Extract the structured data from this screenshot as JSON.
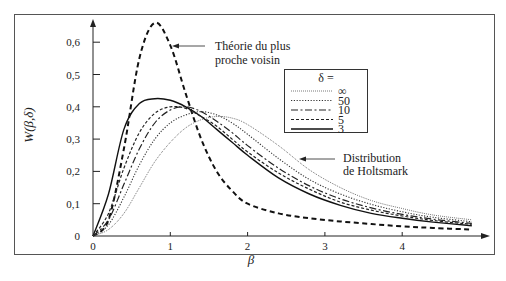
{
  "chart_data": {
    "type": "line",
    "title": "",
    "xlabel": "β",
    "ylabel": "W(β,δ)",
    "xlim": [
      0,
      5
    ],
    "ylim": [
      0,
      0.68
    ],
    "x_ticks": [
      "0",
      "1",
      "2",
      "3",
      "4"
    ],
    "y_ticks": [
      "0",
      "0,1",
      "0,2",
      "0,3",
      "0,4",
      "0,5",
      "0,6"
    ],
    "grid": false,
    "legend": {
      "title": "δ =",
      "position": "upper right (inside)",
      "entries": [
        "∞",
        "50",
        "10",
        "5",
        "3"
      ]
    },
    "annotations": [
      {
        "text_line1": "Théorie du plus",
        "text_line2": "proche voisin",
        "target": "nearest-neighbor curve peak"
      },
      {
        "text_line1": "Distribution",
        "text_line2": "de Holtsmark",
        "target": "δ = ∞ curve"
      }
    ],
    "x": [
      0,
      0.2,
      0.4,
      0.6,
      0.8,
      1.0,
      1.2,
      1.4,
      1.6,
      1.8,
      2.0,
      2.4,
      2.8,
      3.2,
      3.6,
      4.0,
      4.4,
      4.9
    ],
    "series": [
      {
        "name": "Théorie du plus proche voisin",
        "style": "thick-dashed",
        "values": [
          0,
          0.05,
          0.27,
          0.55,
          0.66,
          0.59,
          0.44,
          0.3,
          0.2,
          0.14,
          0.1,
          0.07,
          0.055,
          0.045,
          0.037,
          0.03,
          0.025,
          0.02
        ]
      },
      {
        "name": "δ = 3",
        "style": "solid",
        "values": [
          0,
          0.13,
          0.33,
          0.41,
          0.425,
          0.42,
          0.4,
          0.37,
          0.33,
          0.29,
          0.25,
          0.18,
          0.13,
          0.095,
          0.07,
          0.055,
          0.043,
          0.032
        ]
      },
      {
        "name": "δ = 5",
        "style": "short-dashed",
        "values": [
          0,
          0.07,
          0.21,
          0.32,
          0.38,
          0.4,
          0.395,
          0.37,
          0.34,
          0.3,
          0.26,
          0.195,
          0.145,
          0.105,
          0.08,
          0.062,
          0.048,
          0.036
        ]
      },
      {
        "name": "δ = 10",
        "style": "dash-dot",
        "values": [
          0,
          0.05,
          0.16,
          0.27,
          0.35,
          0.39,
          0.4,
          0.385,
          0.355,
          0.32,
          0.28,
          0.21,
          0.155,
          0.115,
          0.087,
          0.067,
          0.052,
          0.039
        ]
      },
      {
        "name": "δ = 50",
        "style": "dotted",
        "values": [
          0,
          0.035,
          0.12,
          0.22,
          0.3,
          0.35,
          0.375,
          0.385,
          0.375,
          0.35,
          0.315,
          0.24,
          0.175,
          0.13,
          0.098,
          0.075,
          0.058,
          0.044
        ]
      },
      {
        "name": "δ = ∞ (Distribution de Holtsmark)",
        "style": "fine-dotted",
        "values": [
          0,
          0.02,
          0.07,
          0.15,
          0.23,
          0.29,
          0.335,
          0.36,
          0.37,
          0.365,
          0.345,
          0.28,
          0.205,
          0.15,
          0.11,
          0.085,
          0.065,
          0.05
        ]
      }
    ]
  }
}
